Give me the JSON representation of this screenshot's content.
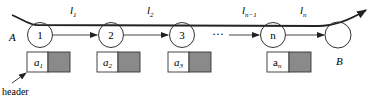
{
  "diagram": {
    "start_label": "A",
    "end_label": "B",
    "header_label": "header",
    "ellipsis": "···",
    "colors": {
      "stroke": "#222222",
      "box_fill_data": "#ffffff",
      "box_fill_pointer": "#8a8a8a",
      "background": "#ffffff"
    },
    "nodes": [
      {
        "label": "1"
      },
      {
        "label": "2"
      },
      {
        "label": "3"
      },
      {
        "label": "n"
      },
      {
        "label": ""
      }
    ],
    "segments": [
      {
        "label": "l",
        "sub": "1"
      },
      {
        "label": "l",
        "sub": "2"
      },
      {
        "label": "l",
        "sub": "n−1"
      },
      {
        "label": "l",
        "sub": "n"
      }
    ],
    "records": [
      {
        "label": "a",
        "sub": "1"
      },
      {
        "label": "a",
        "sub": "2"
      },
      {
        "label": "a",
        "sub": "3"
      },
      {
        "label": "a",
        "sub": "n"
      }
    ]
  }
}
